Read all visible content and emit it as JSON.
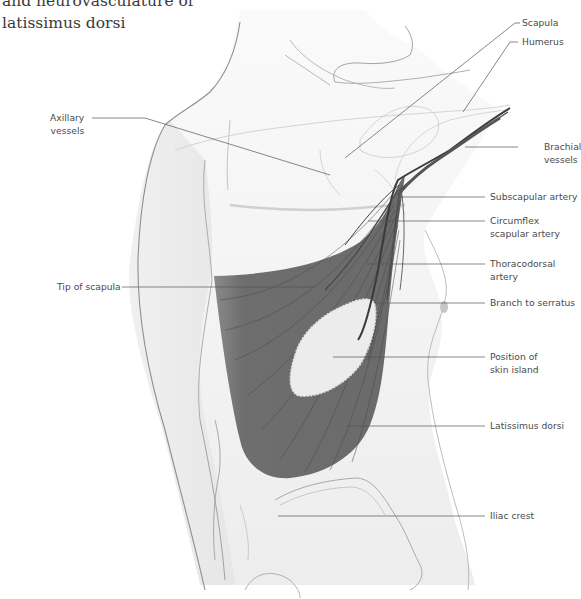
{
  "figure": {
    "title_lines": [
      "and neurovasculature of",
      "latissimus dorsi"
    ]
  },
  "labels": {
    "scapula": {
      "lines": [
        "Scapula"
      ]
    },
    "humerus": {
      "lines": [
        "Humerus"
      ]
    },
    "brachial_vessels": {
      "lines": [
        "Brachial",
        "vessels"
      ]
    },
    "axillary_vessels": {
      "lines": [
        "Axillary",
        "vessels"
      ]
    },
    "subscapular_artery": {
      "lines": [
        "Subscapular artery"
      ]
    },
    "circumflex_scapular_artery": {
      "lines": [
        "Circumflex",
        "scapular artery"
      ]
    },
    "thoracodorsal_artery": {
      "lines": [
        "Thoracodorsal",
        "artery"
      ]
    },
    "tip_of_scapula": {
      "lines": [
        "Tip of scapula"
      ]
    },
    "branch_to_serratus": {
      "lines": [
        "Branch to serratus"
      ]
    },
    "position_of_skin_island": {
      "lines": [
        "Position of",
        "skin island"
      ]
    },
    "latissimus_dorsi": {
      "lines": [
        "Latissimus dorsi"
      ]
    },
    "iliac_crest": {
      "lines": [
        "Iliac crest"
      ]
    }
  },
  "colors": {
    "muscle": "#6e6e6e",
    "skin": "#f2f2f2",
    "outline": "#9a9a9a",
    "leader": "#555555",
    "text": "#4a4a4a"
  }
}
